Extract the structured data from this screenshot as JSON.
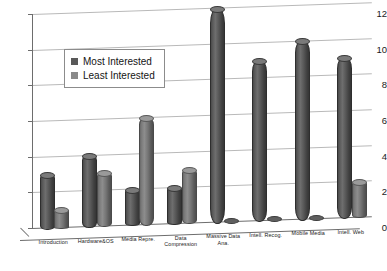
{
  "chart_data": {
    "type": "bar",
    "title": "",
    "subtitle": "",
    "xlabel": "",
    "ylabel": "",
    "ylim": [
      0,
      12
    ],
    "yticks": [
      0,
      2,
      4,
      6,
      8,
      10,
      12
    ],
    "grid": true,
    "legend_position": "upper-left-inside",
    "style": "3d-cylinder-bars",
    "categories": [
      "Introduction",
      "Hardware&OS",
      "Media Repre.",
      "Data Compression",
      "Massive Data Ana.",
      "Intell. Recog.",
      "Mobile Media",
      "Intell. Web"
    ],
    "category_lines": [
      [
        "Introduction"
      ],
      [
        "Hardware&OS"
      ],
      [
        "Media Repre."
      ],
      [
        "Data",
        "Compression"
      ],
      [
        "Massive Data",
        "Ana."
      ],
      [
        "Intell. Recog."
      ],
      [
        "Mobile Media"
      ],
      [
        "Intell. Web"
      ]
    ],
    "series": [
      {
        "name": "Most Interested",
        "color": "#595959",
        "values": [
          3,
          4,
          2,
          2,
          12,
          9,
          10,
          9
        ]
      },
      {
        "name": "Least Interested",
        "color": "#8a8a8a",
        "values": [
          1,
          3,
          6,
          3,
          0,
          0,
          0,
          2
        ]
      }
    ]
  },
  "legend": {
    "items": [
      {
        "label": "Most Interested",
        "swatch": "most"
      },
      {
        "label": "Least Interested",
        "swatch": "least"
      }
    ]
  },
  "axis": {
    "y_tick_labels": [
      "12",
      "10",
      "8",
      "6",
      "4",
      "2",
      "0"
    ]
  }
}
